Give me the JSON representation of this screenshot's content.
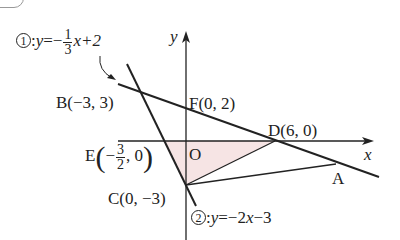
{
  "figure": {
    "equation1": {
      "marker": "1",
      "lhs": "y",
      "eq": "=−",
      "frac_num": "1",
      "frac_den": "3",
      "rest": "x+2"
    },
    "equation2": {
      "marker": "2",
      "lhs": "y",
      "eq": "=−2",
      "rest_x": "x",
      "rest": "−3"
    },
    "axes": {
      "x_label": "x",
      "y_label": "y",
      "origin_label": "O"
    },
    "points": {
      "A": {
        "label": "A"
      },
      "B": {
        "label": "B(−3, 3)"
      },
      "C": {
        "label": "C(0, −3)"
      },
      "D": {
        "label": "D(6, 0)"
      },
      "E": {
        "name": "E",
        "frac_num": "3",
        "frac_den": "2",
        "pre": "−",
        "post": ", 0"
      },
      "F": {
        "label": "F(0, 2)"
      }
    },
    "colors": {
      "line": "#222222",
      "shade": "#f6e4e4"
    }
  }
}
